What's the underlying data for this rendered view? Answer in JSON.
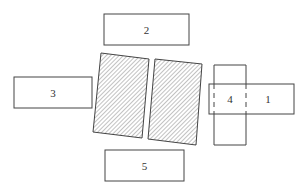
{
  "diagram": {
    "boxes": [
      {
        "id": "1",
        "label": "1"
      },
      {
        "id": "2",
        "label": "2"
      },
      {
        "id": "3",
        "label": "3"
      },
      {
        "id": "4",
        "label": "4"
      },
      {
        "id": "5",
        "label": "5"
      }
    ],
    "hatched_panels": 2,
    "colors": {
      "stroke": "#444444",
      "hatch": "#666666",
      "background": "#ffffff"
    }
  }
}
